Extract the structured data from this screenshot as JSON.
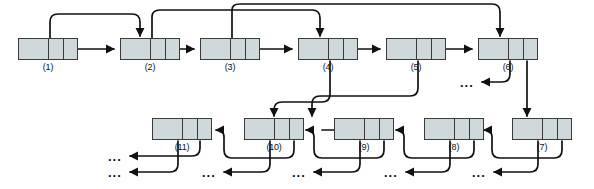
{
  "diagram": {
    "colors": {
      "node_fill": "#cfd9dc",
      "node_stroke": "#3a3a3a",
      "edge": "#111111",
      "background": "#ffffff",
      "label": "#111111"
    },
    "node_layout": {
      "width": 60,
      "height": 22,
      "data_cell_fraction": 0.5,
      "pointer_cells": 2
    },
    "nodes": [
      {
        "id": "n1",
        "label": "(1)",
        "x": 18,
        "y": 38,
        "row": "top"
      },
      {
        "id": "n2",
        "label": "(2)",
        "x": 120,
        "y": 38,
        "row": "top"
      },
      {
        "id": "n3",
        "label": "(3)",
        "x": 200,
        "y": 38,
        "row": "top"
      },
      {
        "id": "n4",
        "label": "(4)",
        "x": 298,
        "y": 38,
        "row": "top"
      },
      {
        "id": "n5",
        "label": "(5)",
        "x": 386,
        "y": 38,
        "row": "top"
      },
      {
        "id": "n6",
        "label": "(6)",
        "x": 478,
        "y": 38,
        "row": "top"
      },
      {
        "id": "n11",
        "label": "(11)",
        "x": 152,
        "y": 118,
        "row": "bottom"
      },
      {
        "id": "n10",
        "label": "(10)",
        "x": 244,
        "y": 118,
        "row": "bottom"
      },
      {
        "id": "n9",
        "label": "(9)",
        "x": 334,
        "y": 118,
        "row": "bottom"
      },
      {
        "id": "n8",
        "label": "(8)",
        "x": 424,
        "y": 118,
        "row": "bottom"
      },
      {
        "id": "n7",
        "label": "(7)",
        "x": 512,
        "y": 118,
        "row": "bottom"
      }
    ],
    "ellipses": [
      {
        "id": "e-top",
        "text": "...",
        "x": 466,
        "y": 82
      },
      {
        "id": "e-b1",
        "text": "...",
        "x": 112,
        "y": 152
      },
      {
        "id": "e-b2",
        "text": "...",
        "x": 112,
        "y": 168
      },
      {
        "id": "e-b3",
        "text": "...",
        "x": 206,
        "y": 168
      },
      {
        "id": "e-b4",
        "text": "...",
        "x": 296,
        "y": 168
      },
      {
        "id": "e-b5",
        "text": "...",
        "x": 388,
        "y": 168
      },
      {
        "id": "e-b6",
        "text": "...",
        "x": 476,
        "y": 168
      }
    ],
    "edges": [
      {
        "id": "n1L-to-n2",
        "from": "n1.left-pointer",
        "to": "n2.top",
        "style": "arc-up"
      },
      {
        "id": "n1R-to-n2",
        "from": "n1.right-pointer",
        "to": "n2.left-side",
        "style": "straight"
      },
      {
        "id": "n2L-to-n4",
        "from": "n2.left-pointer",
        "to": "n4.top",
        "style": "arc-up"
      },
      {
        "id": "n2R-to-n3",
        "from": "n2.right-pointer",
        "to": "n3.left-side",
        "style": "straight"
      },
      {
        "id": "n3L-to-n6",
        "from": "n3.left-pointer",
        "to": "n6.top",
        "style": "arc-up"
      },
      {
        "id": "n3R-to-n4",
        "from": "n3.right-pointer",
        "to": "n4.left-side",
        "style": "straight"
      },
      {
        "id": "n4L-to-n10",
        "from": "n4.left-pointer",
        "to": "n10.top",
        "style": "arc-down"
      },
      {
        "id": "n4R-to-n5",
        "from": "n4.right-pointer",
        "to": "n5.left-side",
        "style": "straight"
      },
      {
        "id": "n5L-to-n8",
        "from": "n5.left-pointer",
        "to": "n8.top",
        "style": "arc-down"
      },
      {
        "id": "n5R-to-n6",
        "from": "n5.right-pointer",
        "to": "n6.left-side",
        "style": "straight"
      },
      {
        "id": "n6L-to-dots",
        "from": "n6.left-pointer",
        "to": "ellipsis",
        "style": "arc-down-left"
      },
      {
        "id": "n6R-to-n7",
        "from": "n6.right-pointer",
        "to": "n7.top",
        "style": "straight-down"
      },
      {
        "id": "n7L-to-dots",
        "from": "n7.left-pointer",
        "to": "ellipsis",
        "style": "arc-down-left"
      },
      {
        "id": "n7R-to-n8",
        "from": "n7.right-pointer",
        "to": "n8.right-side",
        "style": "arc-left"
      },
      {
        "id": "n8L-to-dots",
        "from": "n8.left-pointer",
        "to": "ellipsis",
        "style": "arc-down-left"
      },
      {
        "id": "n8R-to-n9",
        "from": "n8.right-pointer",
        "to": "n9.right-side",
        "style": "arc-left"
      },
      {
        "id": "n9L-to-dots",
        "from": "n9.left-pointer",
        "to": "ellipsis",
        "style": "arc-down-left"
      },
      {
        "id": "n9R-to-n10",
        "from": "n9.right-pointer",
        "to": "n10.right-side",
        "style": "arc-left"
      },
      {
        "id": "n10L-to-dots",
        "from": "n10.left-pointer",
        "to": "ellipsis",
        "style": "arc-down-left"
      },
      {
        "id": "n10R-to-n11",
        "from": "n10.right-pointer",
        "to": "n11.right-side",
        "style": "arc-left"
      },
      {
        "id": "n11L-to-dots",
        "from": "n11.left-pointer",
        "to": "ellipsis",
        "style": "arc-down-left"
      },
      {
        "id": "n11R-to-dots",
        "from": "n11.right-pointer",
        "to": "ellipsis",
        "style": "arc-down-left"
      }
    ]
  }
}
